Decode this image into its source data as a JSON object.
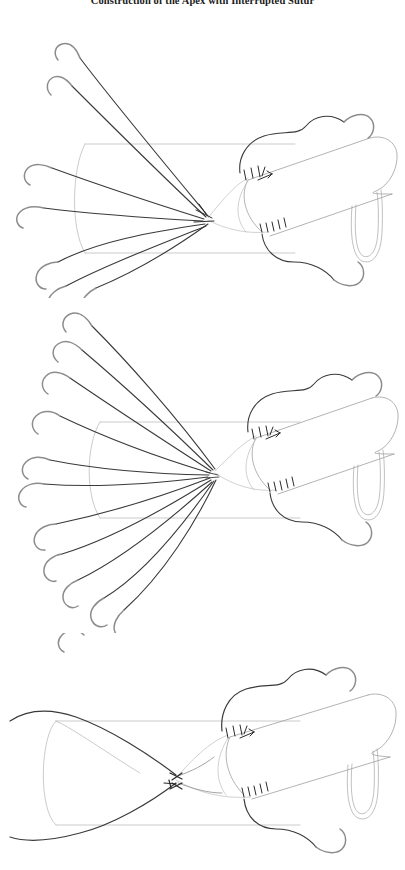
{
  "figure": {
    "title": "Construction of the Apex with Interrupted Sutur",
    "title_full": "Construction of the Apex with Interrupted Sutures",
    "title_truncated": true,
    "page_width": 405,
    "page_height": 870,
    "background_color": "#ffffff",
    "style": "line-art surgical illustration, pen-and-ink",
    "panel_count": 3
  },
  "colors": {
    "suture_thread": "#3a3a3a",
    "needle": "#8c8c8c",
    "vessel_outline": "#b4b4b4",
    "graft_outline": "#9a9a9a",
    "stitch_mark": "#2b2b2b",
    "background": "#ffffff",
    "title_text": "#1a1a1a"
  },
  "panels": [
    {
      "id": "panel-1",
      "index": 1,
      "label": "Step 1 - apex sutures placed and gathered",
      "caption": "",
      "suture_count": 7,
      "upper_suture_count": 4,
      "lower_suture_count": 3,
      "apex_point": {
        "x": 208,
        "y": 200
      },
      "has_needles": true,
      "needle_shape": "curved-hook",
      "stitch_groups": [
        {
          "name": "upper-graft-stitches",
          "count": 4,
          "x": 248,
          "y": 157
        },
        {
          "name": "lower-graft-stitches",
          "count": 5,
          "x": 268,
          "y": 213
        }
      ],
      "graft": {
        "name": "prosthetic-graft-tube",
        "angle_deg": -14,
        "has_vessel_loop": true
      },
      "vessel": {
        "name": "native-vessel-lumen",
        "orientation": "horizontal"
      }
    },
    {
      "id": "panel-2",
      "index": 2,
      "label": "Step 2 - full set of interrupted apex sutures fanned out",
      "caption": "",
      "suture_count": 11,
      "upper_suture_count": 6,
      "lower_suture_count": 5,
      "apex_point": {
        "x": 215,
        "y": 471
      },
      "has_needles": true,
      "needle_shape": "curved-hook",
      "stitch_groups": [
        {
          "name": "upper-graft-stitches",
          "count": 4,
          "x": 258,
          "y": 436
        },
        {
          "name": "lower-graft-stitches",
          "count": 5,
          "x": 275,
          "y": 490
        }
      ],
      "graft": {
        "name": "prosthetic-graft-tube",
        "angle_deg": -14,
        "has_vessel_loop": true
      },
      "vessel": {
        "name": "native-vessel-lumen",
        "orientation": "horizontal"
      }
    },
    {
      "id": "panel-3",
      "index": 3,
      "label": "Step 3 - apex sutures tied down, knots completed",
      "caption": "",
      "suture_count": 2,
      "upper_suture_count": 1,
      "lower_suture_count": 1,
      "apex_point": {
        "x": 176,
        "y": 778
      },
      "has_needles": false,
      "needle_shape": "none",
      "knot_marks": 3,
      "stitch_groups": [
        {
          "name": "upper-graft-stitches",
          "count": 4,
          "x": 238,
          "y": 732
        },
        {
          "name": "lower-graft-stitches",
          "count": 5,
          "x": 258,
          "y": 797
        }
      ],
      "graft": {
        "name": "prosthetic-graft-tube",
        "angle_deg": -14,
        "has_vessel_loop": true
      },
      "vessel": {
        "name": "native-vessel-lumen",
        "orientation": "horizontal"
      }
    }
  ]
}
